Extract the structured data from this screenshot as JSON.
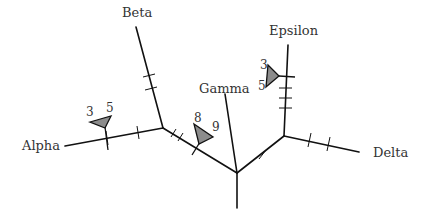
{
  "diagram": {
    "type": "unrooted phylogenetic tree",
    "taxa": [
      {
        "name": "Alpha"
      },
      {
        "name": "Beta"
      },
      {
        "name": "Gamma"
      },
      {
        "name": "Delta"
      },
      {
        "name": "Epsilon"
      }
    ],
    "annotations": [
      {
        "branch": "Alpha",
        "left": "3",
        "right": "5"
      },
      {
        "branch": "internal-alpha-center",
        "left": "8",
        "right": "9"
      },
      {
        "branch": "Epsilon",
        "left": "3",
        "right": "5"
      }
    ],
    "colors": {
      "line": "#111111",
      "marker_fill": "#8c8c8c",
      "text": "#333333"
    }
  }
}
